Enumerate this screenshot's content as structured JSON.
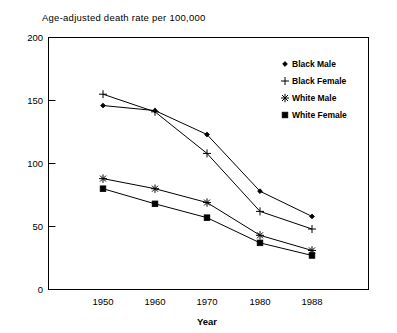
{
  "chart_data": {
    "type": "line",
    "title": "Age-adjusted death rate per 100,000",
    "xlabel": "Year",
    "ylabel": "",
    "categories": [
      "1950",
      "1960",
      "1970",
      "1980",
      "1988"
    ],
    "x": [
      1950,
      1960,
      1970,
      1980,
      1988
    ],
    "ylim": [
      0,
      200
    ],
    "yticks": [
      0,
      50,
      100,
      150,
      200
    ],
    "ytick_labels": [
      "0",
      "50",
      "100",
      "150",
      "200"
    ],
    "grid": false,
    "legend_position": "top-right",
    "series": [
      {
        "name": "Black Male",
        "marker": "small-diamond",
        "values": [
          146,
          142,
          123,
          78,
          58
        ]
      },
      {
        "name": "Black Female",
        "marker": "plus",
        "values": [
          155,
          141,
          108,
          62,
          48
        ]
      },
      {
        "name": "White Male",
        "marker": "asterisk",
        "values": [
          88,
          80,
          69,
          43,
          31
        ]
      },
      {
        "name": "White Female",
        "marker": "filled-square",
        "values": [
          80,
          68,
          57,
          37,
          27
        ]
      }
    ]
  },
  "axes": {
    "y_ticks": [
      {
        "label": "200",
        "value": 200
      },
      {
        "label": "150",
        "value": 150
      },
      {
        "label": "100",
        "value": 100
      },
      {
        "label": "50",
        "value": 50
      },
      {
        "label": "0",
        "value": 0
      }
    ],
    "x_ticks": [
      {
        "label": "1950"
      },
      {
        "label": "1960"
      },
      {
        "label": "1970"
      },
      {
        "label": "1980"
      },
      {
        "label": "1988"
      }
    ],
    "x_axis_title": "Year"
  },
  "legend": {
    "entries": [
      {
        "label": "Black Male",
        "marker": "small-diamond"
      },
      {
        "label": "Black Female",
        "marker": "plus"
      },
      {
        "label": "White Male",
        "marker": "asterisk"
      },
      {
        "label": "White Female",
        "marker": "filled-square"
      }
    ]
  },
  "colors": {
    "ink": "#000000",
    "background": "#ffffff"
  }
}
